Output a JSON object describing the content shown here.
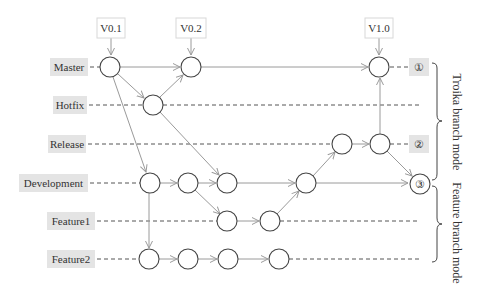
{
  "diagram": {
    "colors": {
      "label_bg": "#e4e4e4",
      "version_border": "#d8d8d8",
      "node_stroke": "#444444",
      "arrow": "#9a9a9a",
      "dash": "#555555",
      "text": "#333333"
    },
    "versions": [
      {
        "label": "V0.1"
      },
      {
        "label": "V0.2"
      },
      {
        "label": "V1.0"
      }
    ],
    "branches": [
      {
        "label": "Master"
      },
      {
        "label": "Hotfix"
      },
      {
        "label": "Release"
      },
      {
        "label": "Development"
      },
      {
        "label": "Feature1"
      },
      {
        "label": "Feature2"
      }
    ],
    "markers": [
      {
        "label": "①"
      },
      {
        "label": "②"
      },
      {
        "label": "③"
      }
    ],
    "groups": [
      {
        "label": "Troika branch mode"
      },
      {
        "label": "Feature branch mode"
      }
    ]
  }
}
